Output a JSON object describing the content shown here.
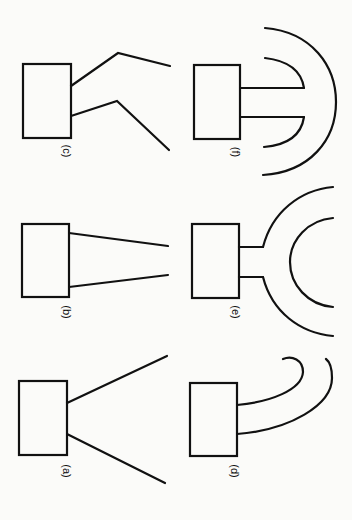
{
  "figure": {
    "orientation": "rotated 90 degrees clockwise",
    "background": "#fbfbf9",
    "stroke_color": "#111111",
    "panels": [
      {
        "id": "a",
        "label": "(a)",
        "description": "box with two straight diverging lines (wide flare horn)"
      },
      {
        "id": "b",
        "label": "(b)",
        "description": "box with two straight slightly diverging lines (narrow taper horn)"
      },
      {
        "id": "c",
        "label": "(c)",
        "description": "box with two bent lines (dual-flare horn)"
      },
      {
        "id": "d",
        "label": "(d)",
        "description": "box with two curved lines bending to one side (bent/curved horn)"
      },
      {
        "id": "e",
        "label": "(e)",
        "description": "box with short stubs opening into two concentric curved arcs facing away (reflector horn)"
      },
      {
        "id": "f",
        "label": "(f)",
        "description": "box with two parallel lines terminated by a semicircular inner arc and a larger outer arc (folded horn)"
      }
    ]
  }
}
